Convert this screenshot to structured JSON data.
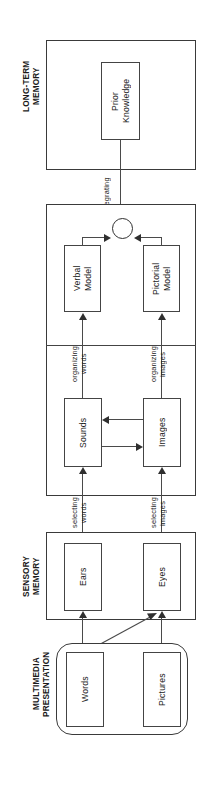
{
  "diagram": {
    "orientation": "rotated-90-ccw",
    "stages": [
      {
        "id": "multimedia-presentation",
        "label": "MULTIMEDIA\nPRESENTATION"
      },
      {
        "id": "sensory-memory",
        "label": "SENSORY\nMEMORY"
      },
      {
        "id": "working-memory",
        "label": "WORKING MEMORY"
      },
      {
        "id": "long-term-memory",
        "label": "LONG-TERM\nMEMORY"
      }
    ],
    "nodes": [
      {
        "id": "words",
        "label": "Words",
        "stage": "multimedia-presentation"
      },
      {
        "id": "pictures",
        "label": "Pictures",
        "stage": "multimedia-presentation"
      },
      {
        "id": "ears",
        "label": "Ears",
        "stage": "sensory-memory"
      },
      {
        "id": "eyes",
        "label": "Eyes",
        "stage": "sensory-memory"
      },
      {
        "id": "sounds",
        "label": "Sounds",
        "stage": "working-memory"
      },
      {
        "id": "images",
        "label": "Images",
        "stage": "working-memory"
      },
      {
        "id": "verbal-model",
        "label": "Verbal\nModel",
        "stage": "working-memory"
      },
      {
        "id": "pictorial-model",
        "label": "Pictorial\nModel",
        "stage": "working-memory"
      },
      {
        "id": "prior-knowledge",
        "label": "Prior\nKnowledge",
        "stage": "long-term-memory"
      }
    ],
    "edges": [
      {
        "id": "selecting-words",
        "label": "selecting\nwords",
        "from": "ears",
        "to": "sounds"
      },
      {
        "id": "selecting-images",
        "label": "selecting\nimages",
        "from": "eyes",
        "to": "images"
      },
      {
        "id": "organizing-words",
        "label": "organizing\nwords",
        "from": "sounds",
        "to": "verbal-model"
      },
      {
        "id": "organizing-images",
        "label": "organizing\nimages",
        "from": "images",
        "to": "pictorial-model"
      },
      {
        "id": "integrating",
        "label": "integrating",
        "from": "prior-knowledge",
        "to": "integration-junction"
      },
      {
        "id": "words-to-ears",
        "label": "",
        "from": "words",
        "to": "ears"
      },
      {
        "id": "words-to-eyes",
        "label": "",
        "from": "words",
        "to": "eyes"
      },
      {
        "id": "pictures-to-eyes",
        "label": "",
        "from": "pictures",
        "to": "eyes"
      },
      {
        "id": "sounds-to-images",
        "label": "",
        "from": "sounds",
        "to": "images"
      },
      {
        "id": "images-to-sounds",
        "label": "",
        "from": "images",
        "to": "sounds"
      },
      {
        "id": "verbal-to-junction",
        "label": "",
        "from": "verbal-model",
        "to": "integration-junction"
      },
      {
        "id": "pictorial-to-junction",
        "label": "",
        "from": "pictorial-model",
        "to": "integration-junction"
      }
    ],
    "junction": {
      "id": "integration-junction",
      "label": ""
    },
    "colors": {
      "stroke": "#3a3a3a",
      "text": "#1a1a1a",
      "background": "#ffffff"
    }
  }
}
